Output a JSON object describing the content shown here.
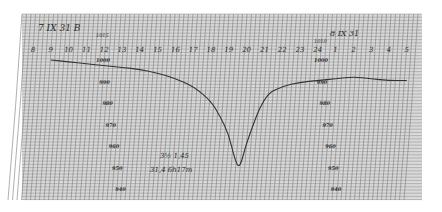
{
  "chart_data": {
    "type": "line",
    "title": "",
    "annotations": {
      "top_left": "7 IX 31 B",
      "top_right": "8 IX 31",
      "scale_top_left": "1015",
      "scale_top_right": "1010",
      "note_line1": "3½ 1,45",
      "note_line2": "31,4 6h17m"
    },
    "xlabel": "",
    "ylabel": "",
    "x_tick_labels": [
      "8",
      "9",
      "10",
      "11",
      "12",
      "13",
      "14",
      "15",
      "16",
      "17",
      "18",
      "19",
      "20",
      "21",
      "22",
      "23",
      "24",
      "1",
      "2",
      "3",
      "4",
      "5"
    ],
    "y_scale_left": [
      "1000",
      "990",
      "980",
      "970",
      "960",
      "950",
      "940"
    ],
    "y_scale_right": [
      "1000",
      "990",
      "980",
      "970",
      "960",
      "950",
      "940"
    ],
    "ylim": [
      935,
      1010
    ],
    "grid": true,
    "series": [
      {
        "name": "pressure trace",
        "x_hours": [
          9,
          10,
          11,
          12,
          13,
          14,
          15,
          16,
          17,
          18,
          18.5,
          19,
          19.3,
          19.6,
          20,
          21,
          22,
          23,
          24,
          25,
          26,
          27,
          28,
          29
        ],
        "values": [
          1002,
          1001,
          1000,
          999,
          998,
          997,
          995,
          992,
          988,
          980,
          972,
          962,
          950,
          943,
          958,
          983,
          988,
          990,
          991,
          992,
          993,
          992,
          991,
          991
        ]
      }
    ]
  }
}
